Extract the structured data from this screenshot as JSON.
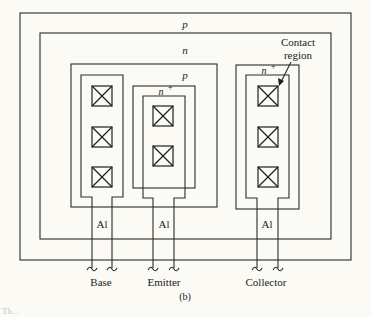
{
  "diagram": {
    "regions": {
      "outer": "p",
      "well": "n",
      "base_diffusion": "p",
      "emitter_diffusion": "n+",
      "collector_contact_diffusion": "n+"
    },
    "region_labels": {
      "outer_p": "p",
      "n": "n",
      "inner_p": "p",
      "emitter_n_base": "n",
      "emitter_n_sup": "+",
      "collector_n_base": "n",
      "collector_n_sup": "+"
    },
    "annotation": {
      "line1": "Contact",
      "line2": "region"
    },
    "metal_label": "Al",
    "terminals": {
      "base": "Base",
      "emitter": "Emitter",
      "collector": "Collector"
    },
    "contacts": {
      "base_count": 3,
      "emitter_count": 2,
      "collector_count": 3
    },
    "subfigure_label": "(b)",
    "partial_caption": "Th..."
  }
}
